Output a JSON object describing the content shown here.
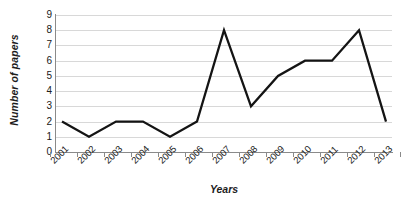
{
  "chart_data": {
    "type": "line",
    "title": "",
    "xlabel": "Years",
    "ylabel": "Number of papers",
    "categories": [
      "2001",
      "2002",
      "2003",
      "2004",
      "2005",
      "2006",
      "2007",
      "2008",
      "2009",
      "2010",
      "2011",
      "2012",
      "2013"
    ],
    "values": [
      2,
      1,
      2,
      2,
      1,
      2,
      8,
      3,
      5,
      6,
      6,
      8,
      2
    ],
    "series": [
      {
        "name": "Number of papers",
        "values": [
          2,
          1,
          2,
          2,
          1,
          2,
          8,
          3,
          5,
          6,
          6,
          8,
          2
        ]
      }
    ],
    "ylim": [
      0,
      9
    ],
    "y_ticks": [
      0,
      1,
      2,
      3,
      4,
      5,
      6,
      7,
      8,
      9
    ],
    "y_tick_labels": [
      "0",
      "1",
      "2",
      "3",
      "4",
      "5",
      "6",
      "7",
      "8",
      "9"
    ],
    "grid": true,
    "grid_axis": "y",
    "legend": "none",
    "markers": "none",
    "line_color": "#141414",
    "grid_color": "#d8d8d8",
    "axis_color": "#8a8a8a",
    "background_color": "#ffffff",
    "x_tick_label_rotation": -45
  }
}
